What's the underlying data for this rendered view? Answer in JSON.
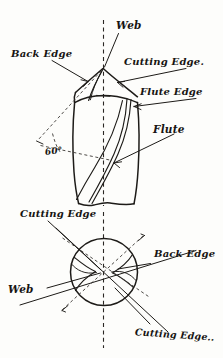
{
  "figure": {
    "background_color": "#fdfdfb",
    "ink_color": "#1d1b18",
    "medium": "pen-and-ink hand drawing"
  },
  "views": {
    "side": {
      "name": "side-elevation-of-drill-point",
      "description": "Conical drill point with helical flutes, vertical dashed centre axis"
    },
    "end": {
      "name": "end-view-of-drill-point",
      "description": "Circular end view with S-shaped web curves and crossing leader lines"
    }
  },
  "labels": {
    "web_top": "Web",
    "back_edge_top": "Back Edge",
    "cutting_edge_top": "Cutting Edge.",
    "flute_edge": "Flute Edge",
    "flute": "Flute",
    "point_angle": "60°",
    "cutting_edge_mid": "Cutting Edge",
    "back_edge_bottom": "Back Edge",
    "web_bottom": "Web",
    "cutting_edge_bottom": "Cutting Edge.."
  }
}
